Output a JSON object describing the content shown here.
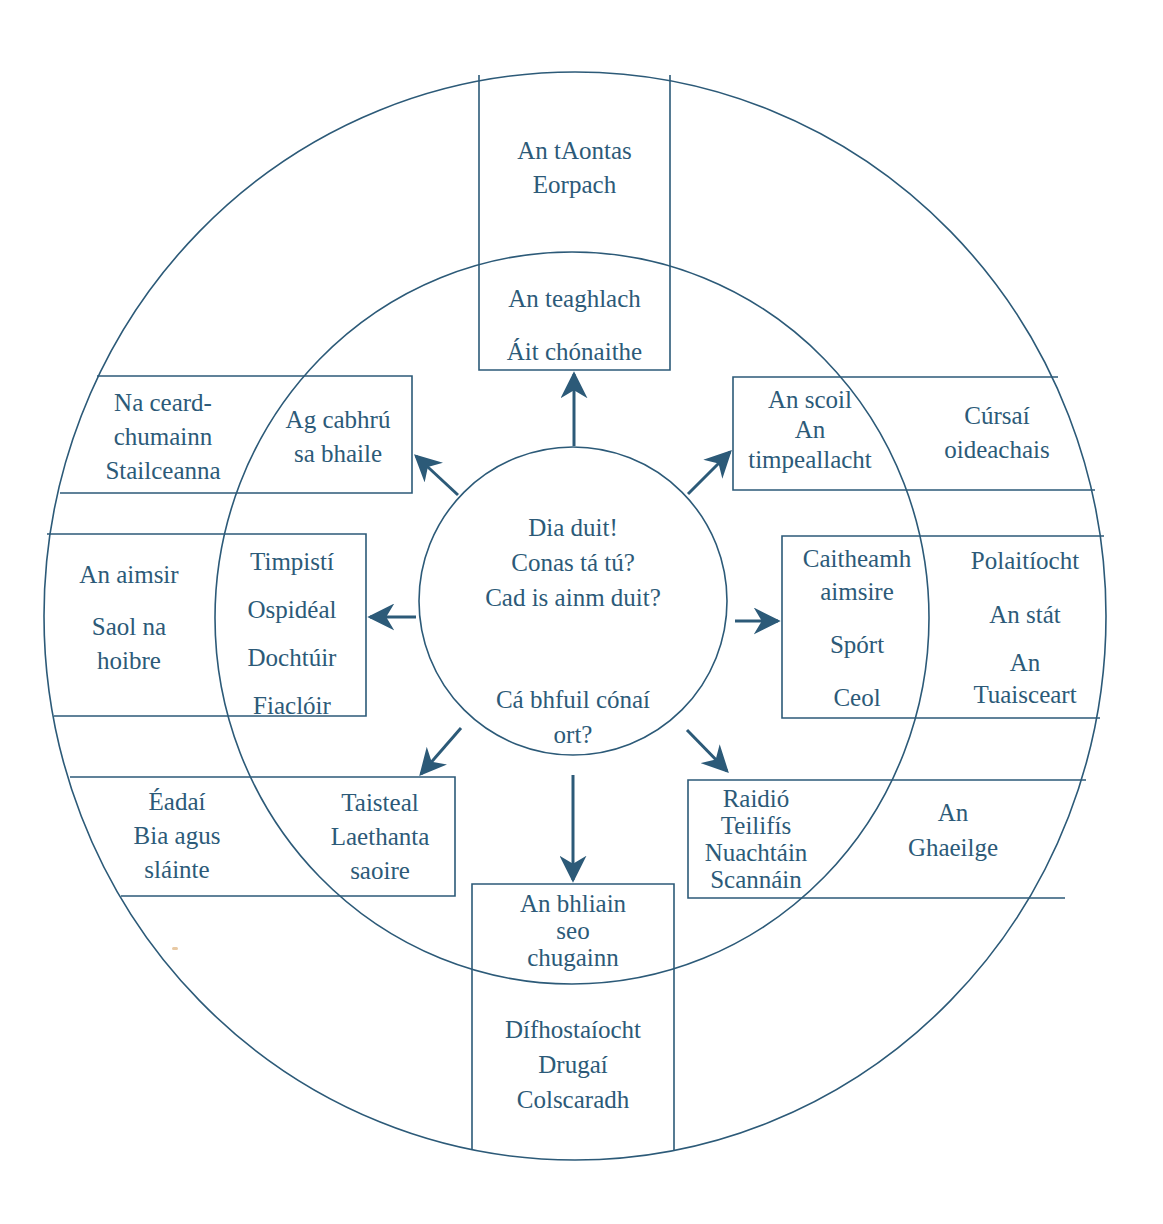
{
  "colors": {
    "line": "#2c5a78",
    "text": "#2c5a78",
    "background": "#ffffff"
  },
  "center": {
    "greeting_lines": [
      "Dia duit!",
      "Conas tá tú?",
      "Cad is ainm duit?"
    ],
    "question_lines": [
      "Cá bhfuil cónaí",
      "ort?"
    ]
  },
  "arms": [
    {
      "direction": "top",
      "inner": [
        "An teaghlach",
        "Áit chónaithe"
      ],
      "outer": [
        "An tAontas",
        "Eorpach"
      ]
    },
    {
      "direction": "top-right",
      "inner": [
        "An scoil",
        "An",
        "timpeallacht"
      ],
      "outer": [
        "Cúrsaí",
        "oideachais"
      ]
    },
    {
      "direction": "right",
      "inner": [
        "Caitheamh",
        "aimsire",
        "Spórt",
        "Ceol"
      ],
      "outer": [
        "Polaitíocht",
        "An stát",
        "An",
        "Tuaisceart"
      ]
    },
    {
      "direction": "bottom-right",
      "inner": [
        "Raidió",
        "Teilifís",
        "Nuachtáin",
        "Scannáin"
      ],
      "outer": [
        "An",
        "Ghaeilge"
      ]
    },
    {
      "direction": "bottom",
      "inner": [
        "An bhliain",
        "seo",
        "chugainn"
      ],
      "outer": [
        "Dífhostaíocht",
        "Drugaí",
        "Colscaradh"
      ]
    },
    {
      "direction": "bottom-left",
      "inner": [
        "Taisteal",
        "Laethanta",
        "saoire"
      ],
      "outer": [
        "Éadaí",
        "Bia agus",
        "sláinte"
      ]
    },
    {
      "direction": "left",
      "inner": [
        "Timpistí",
        "Ospidéal",
        "Dochtúir",
        "Fiaclóir"
      ],
      "outer": [
        "An aimsir",
        "Saol na",
        "hoibre"
      ]
    },
    {
      "direction": "top-left",
      "inner": [
        "Ag cabhrú",
        "sa bhaile"
      ],
      "outer": [
        "Na ceard-",
        "chumainn",
        "Stailceanna"
      ]
    }
  ]
}
